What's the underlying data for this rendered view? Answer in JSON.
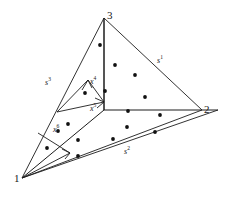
{
  "figure": {
    "title": "",
    "type": "simplex-subdivision-diagram",
    "background_color": "#ffffff",
    "line_color": "#1c1c1c",
    "dot_color": "#111111",
    "vertices": [
      {
        "id": "v1",
        "label": "1",
        "x": 22,
        "y": 178
      },
      {
        "id": "v2",
        "label": "2",
        "x": 202,
        "y": 110
      },
      {
        "id": "v3",
        "label": "3",
        "x": 104,
        "y": 18
      }
    ],
    "vertex_label_positions": [
      {
        "for": "1",
        "x": 15,
        "y": 179
      },
      {
        "for": "2",
        "x": 203,
        "y": 110
      },
      {
        "for": "3",
        "x": 106,
        "y": 12
      }
    ],
    "edge_labels": [
      {
        "id": "s1",
        "text": "s",
        "sup": "1",
        "x": 158,
        "y": 62,
        "edge": "3-2"
      },
      {
        "id": "s2",
        "text": "s",
        "sup": "2",
        "x": 126,
        "y": 153,
        "edge": "1-2"
      },
      {
        "id": "s3",
        "text": "s",
        "sup": "3",
        "x": 47,
        "y": 84,
        "edge": "1-3"
      }
    ],
    "point_labels": [
      {
        "id": "x4",
        "text": "x",
        "sup": "4",
        "x": 89,
        "y": 85
      },
      {
        "id": "x5",
        "text": "x",
        "sup": "5",
        "x": 89,
        "y": 111
      },
      {
        "id": "x6",
        "text": "x",
        "sup": "6",
        "x": 54,
        "y": 131
      }
    ],
    "scatter_points": [
      {
        "x": 100,
        "y": 45
      },
      {
        "x": 115,
        "y": 65
      },
      {
        "x": 135,
        "y": 75
      },
      {
        "x": 105,
        "y": 91
      },
      {
        "x": 145,
        "y": 97
      },
      {
        "x": 128,
        "y": 111
      },
      {
        "x": 160,
        "y": 115
      },
      {
        "x": 127,
        "y": 127
      },
      {
        "x": 113,
        "y": 139
      },
      {
        "x": 155,
        "y": 132
      },
      {
        "x": 85,
        "y": 93
      },
      {
        "x": 68,
        "y": 124
      },
      {
        "x": 58,
        "y": 131
      },
      {
        "x": 78,
        "y": 140
      },
      {
        "x": 47,
        "y": 148
      },
      {
        "x": 78,
        "y": 156
      }
    ],
    "outer_triangle": "22,178 104,18 202,110",
    "center_junction": {
      "x": 104,
      "y": 110
    },
    "interior_segments": [
      {
        "id": "seg-center-to-v3",
        "from": [
          104,
          110
        ],
        "to": [
          104,
          18
        ]
      },
      {
        "id": "seg-center-to-v2",
        "from": [
          104,
          110
        ],
        "to": [
          218,
          110
        ]
      },
      {
        "id": "seg-center-to-v1",
        "from": [
          104,
          110
        ],
        "to": [
          22,
          178
        ]
      },
      {
        "id": "seg-subcell-top",
        "from": [
          57,
          112
        ],
        "to": [
          88,
          80
        ]
      },
      {
        "id": "seg-subcell-right",
        "from": [
          88,
          80
        ],
        "to": [
          104,
          102
        ]
      },
      {
        "id": "seg-subcell-bottom",
        "from": [
          57,
          112
        ],
        "to": [
          104,
          102
        ]
      },
      {
        "id": "seg-small-left",
        "from": [
          38,
          133
        ],
        "to": [
          70,
          153
        ]
      },
      {
        "id": "seg-small-base",
        "from": [
          22,
          178
        ],
        "to": [
          70,
          153
        ]
      },
      {
        "id": "seg-v1-to-v2-lower",
        "from": [
          22,
          178
        ],
        "to": [
          218,
          110
        ]
      }
    ]
  }
}
